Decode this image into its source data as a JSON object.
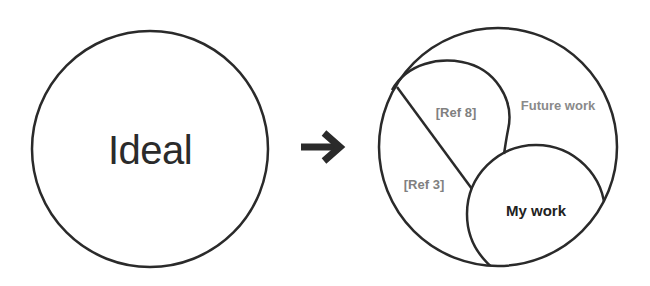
{
  "diagram": {
    "left_circle": {
      "label": "Ideal"
    },
    "arrow": {
      "icon": "right-arrow-icon"
    },
    "right_circle": {
      "regions": [
        {
          "id": "ref8",
          "label": "[Ref 8]"
        },
        {
          "id": "future",
          "label": "Future work"
        },
        {
          "id": "ref3",
          "label": "[Ref 3]"
        },
        {
          "id": "mywork",
          "label": "My work"
        }
      ]
    },
    "colors": {
      "stroke": "#2a2a2a",
      "label_gray": "#808080",
      "label_dark": "#222222",
      "background": "#ffffff"
    }
  }
}
